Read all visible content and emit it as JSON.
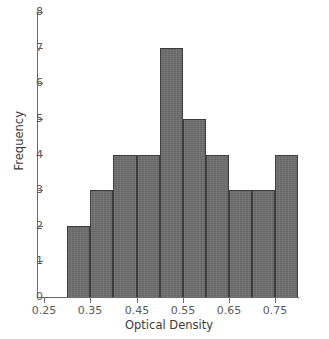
{
  "chart_data": {
    "type": "bar",
    "title": "",
    "xlabel": "Optical Density",
    "ylabel": "Frequency",
    "categories": [
      "0.30-0.35",
      "0.35-0.40",
      "0.40-0.45",
      "0.45-0.50",
      "0.50-0.55",
      "0.55-0.60",
      "0.60-0.65",
      "0.65-0.70",
      "0.70-0.75",
      "0.75-0.80"
    ],
    "bin_edges": [
      0.3,
      0.35,
      0.4,
      0.45,
      0.5,
      0.55,
      0.6,
      0.65,
      0.7,
      0.75,
      0.8
    ],
    "bin_width": 0.05,
    "values": [
      2,
      3,
      4,
      4,
      7,
      5,
      4,
      3,
      3,
      4
    ],
    "total_count": 39,
    "xlim": [
      0.25,
      0.8
    ],
    "ylim": [
      0,
      8
    ],
    "x_ticks": [
      0.25,
      0.35,
      0.45,
      0.55,
      0.65,
      0.75
    ],
    "x_tick_labels": [
      "0.25",
      "0.35",
      "0.45",
      "0.55",
      "0.65",
      "0.75"
    ],
    "y_ticks": [
      0,
      1,
      2,
      3,
      4,
      5,
      6,
      7,
      8
    ],
    "y_tick_labels": [
      "0",
      "1",
      "2",
      "3",
      "4",
      "5",
      "6",
      "7",
      "8"
    ],
    "grid": false,
    "legend": "none",
    "bar_fill_color": "#6e6e6e",
    "bar_edge_color": "#3d3d3d",
    "axis_color": "#6b6b6b",
    "tick_label_color": "#5a5a5a",
    "axis_title_color": "#3a3a3a",
    "background_color": "#ffffff"
  }
}
